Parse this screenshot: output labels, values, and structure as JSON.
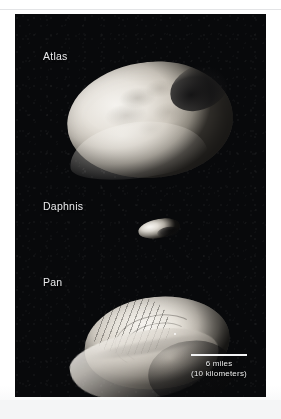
{
  "figure": {
    "background_color": "#08090b",
    "page_color": "#ffffff",
    "label_color": "#e9eaec"
  },
  "moons": [
    {
      "id": "atlas",
      "label": "Atlas",
      "description": "flattened ravioli-shaped moon with smooth equatorial skirt"
    },
    {
      "id": "daphnis",
      "label": "Daphnis",
      "description": "small elongated moon"
    },
    {
      "id": "pan",
      "label": "Pan",
      "description": "walnut-shaped moon with prominent equatorial ridge"
    }
  ],
  "scale_bar": {
    "primary": "6 miles",
    "secondary": "(10 kilometers)",
    "line_color": "#f2f3f4"
  }
}
